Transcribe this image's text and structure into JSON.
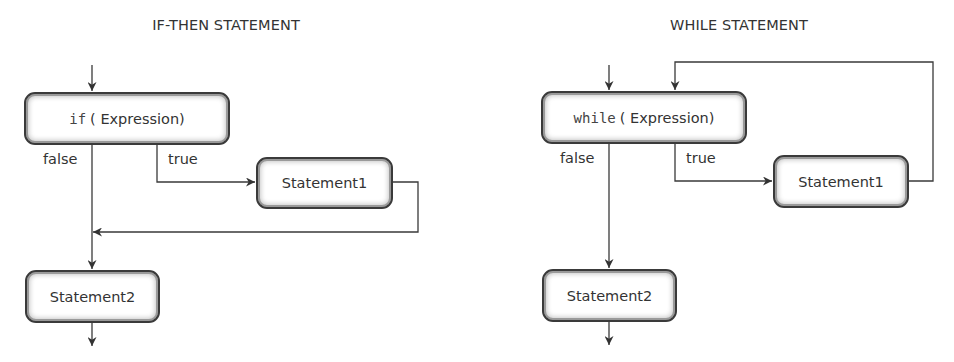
{
  "diagrams": [
    {
      "title": "IF-THEN STATEMENT",
      "condition_box": {
        "keyword": "if",
        "text": "( Expression)"
      },
      "branch_false_label": "false",
      "branch_true_label": "true",
      "statement1": "Statement1",
      "statement2": "Statement2"
    },
    {
      "title": "WHILE STATEMENT",
      "condition_box": {
        "keyword": "while",
        "text": "( Expression)"
      },
      "branch_false_label": "false",
      "branch_true_label": "true",
      "statement1": "Statement1",
      "statement2": "Statement2"
    }
  ],
  "colors": {
    "line": "#3a3a3a",
    "text": "#333333",
    "background": "#ffffff"
  }
}
